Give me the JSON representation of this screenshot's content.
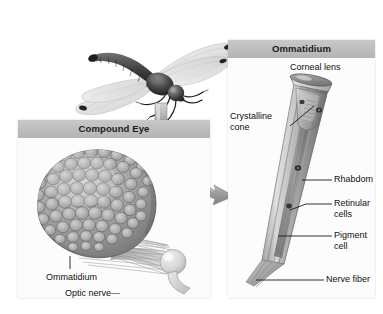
{
  "figure": {
    "kind": "biology-diagram",
    "background_color": "#ffffff",
    "header_color": "#bdbdbd",
    "panel_color": "#fcfcfc",
    "ink_color": "#111111"
  },
  "specimen": {
    "name": "dragonfly-photo",
    "description": "Grayscale photograph of a dragonfly in flight, viewed from the side with four outstretched wings"
  },
  "arrows": [
    {
      "name": "arrow-dragonfly-to-compound-eye",
      "direction": "down",
      "label": ""
    },
    {
      "name": "arrow-compound-eye-to-ommatidium",
      "direction": "right",
      "label": ""
    }
  ],
  "panels": [
    {
      "id": "compound-eye",
      "title": "Compound Eye",
      "labels": [
        {
          "id": "ommatidium",
          "text": "Ommatidium",
          "leader": "vertical"
        },
        {
          "id": "optic-nerve",
          "text": "Optic nerve",
          "leader": "dash-right",
          "leader_glyph": "—"
        }
      ]
    },
    {
      "id": "ommatidium",
      "title": "Ommatidium",
      "labels": [
        {
          "id": "corneal-lens",
          "text": "Corneal lens",
          "leader": "none"
        },
        {
          "id": "crystalline-cone",
          "text": "Crystalline cone",
          "line1": "Crystalline",
          "line2": "cone",
          "leader": "diagonal-right"
        },
        {
          "id": "rhabdom",
          "text": "Rhabdom",
          "leader": "horizontal-left"
        },
        {
          "id": "retinular-cells",
          "text": "Retinular cells",
          "line1": "Retinular",
          "line2": "cells",
          "leader": "diagonal-left"
        },
        {
          "id": "pigment-cell",
          "text": "Pigment cell",
          "line1": "Pigment",
          "line2": "cell",
          "leader": "horizontal-left"
        },
        {
          "id": "nerve-fiber",
          "text": "Nerve fiber",
          "leader": "horizontal-left"
        }
      ]
    }
  ]
}
